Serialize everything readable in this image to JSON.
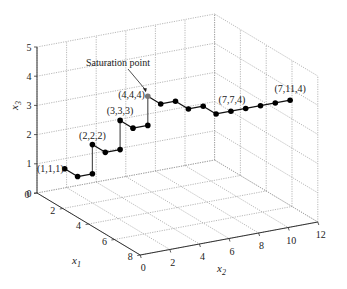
{
  "chart_data": {
    "type": "line3d",
    "title": "",
    "xlabel": "x1",
    "ylabel": "x2",
    "zlabel": "x3",
    "xlim": [
      0,
      8
    ],
    "ylim": [
      0,
      12
    ],
    "zlim": [
      0,
      5
    ],
    "x1_ticks": [
      0,
      2,
      4,
      6,
      8
    ],
    "x2_ticks": [
      0,
      2,
      4,
      6,
      8,
      10,
      12
    ],
    "x3_ticks": [
      0,
      1,
      2,
      3,
      4,
      5
    ],
    "grid": true,
    "points": [
      [
        1,
        1,
        1
      ],
      [
        2,
        1,
        1
      ],
      [
        2,
        2,
        1
      ],
      [
        2,
        2,
        2
      ],
      [
        3,
        2,
        2
      ],
      [
        3,
        3,
        2
      ],
      [
        3,
        3,
        3
      ],
      [
        4,
        3,
        3
      ],
      [
        4,
        4,
        3
      ],
      [
        4,
        4,
        4
      ],
      [
        5,
        4,
        4
      ],
      [
        5,
        5,
        4
      ],
      [
        6,
        5,
        4
      ],
      [
        6,
        6,
        4
      ],
      [
        7,
        6,
        4
      ],
      [
        7,
        7,
        4
      ],
      [
        7,
        8,
        4
      ],
      [
        7,
        9,
        4
      ],
      [
        7,
        10,
        4
      ],
      [
        7,
        11,
        4
      ]
    ],
    "highlight_point": [
      4,
      4,
      4
    ],
    "point_labels": [
      {
        "point": [
          1,
          1,
          1
        ],
        "text": "(1,1,1)"
      },
      {
        "point": [
          2,
          2,
          2
        ],
        "text": "(2,2,2)"
      },
      {
        "point": [
          3,
          3,
          3
        ],
        "text": "(3,3,3)"
      },
      {
        "point": [
          4,
          4,
          4
        ],
        "text": "(4,4,4)"
      },
      {
        "point": [
          7,
          7,
          4
        ],
        "text": "(7,7,4)"
      },
      {
        "point": [
          7,
          11,
          4
        ],
        "text": "(7,11,4)"
      }
    ],
    "annotations": [
      {
        "text": "Saturation point",
        "target": [
          4,
          4,
          4
        ]
      }
    ]
  }
}
